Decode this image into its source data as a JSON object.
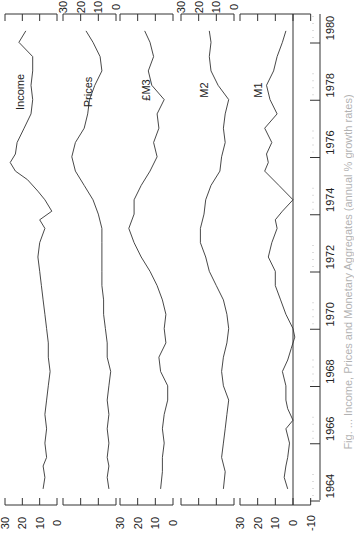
{
  "chart_data": {
    "type": "line",
    "orientation": "rotated-90-clockwise",
    "title": "",
    "caption": "Fig. ... Income, Prices and Monetary Aggregates (annual % growth rates)",
    "xlabel": "",
    "x_ticks": [
      "1964",
      "1966",
      "1968",
      "1970",
      "1972",
      "1974",
      "1976",
      "1978",
      "1980"
    ],
    "xlim": [
      1963.5,
      1980.5
    ],
    "panels": [
      {
        "name": "Income",
        "ylim": [
          0,
          30
        ],
        "y_ticks": [
          "30",
          "20",
          "10",
          "0"
        ],
        "labels_side": "bottom"
      },
      {
        "name": "Prices",
        "ylim": [
          0,
          30
        ],
        "y_ticks": [
          "30",
          "20",
          "10",
          "0"
        ],
        "labels_side": "top"
      },
      {
        "name": "£M3",
        "ylim": [
          0,
          30
        ],
        "y_ticks": [
          "30",
          "20",
          "10",
          "0"
        ],
        "labels_side": "bottom"
      },
      {
        "name": "M2",
        "ylim": [
          0,
          30
        ],
        "y_ticks": [
          "30",
          "20",
          "10",
          "0"
        ],
        "labels_side": "top"
      },
      {
        "name": "M1",
        "ylim": [
          -10,
          30
        ],
        "y_ticks": [
          "30",
          "20",
          "10",
          "0",
          "-10"
        ],
        "labels_side": "bottom",
        "zero_line": true
      }
    ],
    "series": [
      {
        "name": "Income",
        "x": [
          1963.9,
          1964.3,
          1964.7,
          1965.0,
          1965.5,
          1966.0,
          1966.5,
          1967.0,
          1967.5,
          1968.0,
          1968.5,
          1969.0,
          1969.5,
          1970.0,
          1970.5,
          1971.0,
          1971.5,
          1972.0,
          1972.5,
          1973.0,
          1973.3,
          1973.6,
          1974.0,
          1974.3,
          1974.7,
          1975.0,
          1975.3,
          1975.6,
          1976.0,
          1976.5,
          1977.0,
          1977.5,
          1978.0,
          1978.5,
          1979.0,
          1979.5,
          1979.9
        ],
        "values": [
          8,
          7,
          8,
          6,
          7,
          6,
          7,
          6,
          5,
          4,
          5,
          5,
          6,
          7,
          8,
          9,
          10,
          11,
          10,
          7,
          10,
          3,
          7,
          11,
          17,
          24,
          27,
          24,
          23,
          19,
          15,
          14,
          15,
          14,
          14,
          22,
          18
        ]
      },
      {
        "name": "Prices",
        "x": [
          1963.9,
          1964.3,
          1964.7,
          1965.0,
          1965.5,
          1966.0,
          1966.5,
          1967.0,
          1967.5,
          1968.0,
          1968.5,
          1969.0,
          1969.5,
          1970.0,
          1970.5,
          1971.0,
          1971.5,
          1972.0,
          1972.5,
          1973.0,
          1973.5,
          1974.0,
          1974.5,
          1975.0,
          1975.5,
          1976.0,
          1976.5,
          1977.0,
          1977.5,
          1978.0,
          1978.5,
          1979.0,
          1979.5,
          1979.9
        ],
        "values": [
          4,
          5,
          4,
          5,
          4,
          5,
          4,
          5,
          4,
          3,
          5,
          5,
          6,
          7,
          7,
          8,
          8,
          8,
          8,
          8,
          10,
          13,
          18,
          23,
          25,
          23,
          18,
          16,
          15,
          12,
          8,
          9,
          13,
          17
        ]
      },
      {
        "name": "£M3",
        "x": [
          1963.9,
          1964.5,
          1965.0,
          1965.5,
          1966.0,
          1966.5,
          1967.0,
          1967.5,
          1968.0,
          1968.5,
          1969.0,
          1969.5,
          1970.0,
          1970.5,
          1971.0,
          1971.5,
          1972.0,
          1972.5,
          1973.0,
          1973.5,
          1974.0,
          1974.5,
          1975.0,
          1975.5,
          1976.0,
          1976.5,
          1977.0,
          1977.5,
          1978.0,
          1978.5,
          1979.0,
          1979.5,
          1979.9
        ],
        "values": [
          7,
          6,
          6,
          5,
          6,
          5,
          3,
          3,
          7,
          8,
          4,
          5,
          4,
          6,
          9,
          13,
          18,
          22,
          25,
          22,
          22,
          18,
          13,
          9,
          11,
          8,
          9,
          5,
          12,
          14,
          11,
          13,
          16
        ]
      },
      {
        "name": "M2",
        "x": [
          1963.9,
          1964.5,
          1965.0,
          1965.5,
          1966.0,
          1966.5,
          1967.0,
          1967.5,
          1968.0,
          1968.5,
          1969.0,
          1969.5,
          1970.0,
          1970.5,
          1971.0,
          1971.5,
          1972.0,
          1972.5,
          1973.0,
          1973.5,
          1974.0,
          1974.5,
          1975.0,
          1975.5,
          1976.0,
          1976.5,
          1977.0,
          1977.5,
          1978.0,
          1978.5,
          1979.0,
          1979.5,
          1979.9
        ],
        "values": [
          6,
          5,
          7,
          6,
          5,
          4,
          3,
          6,
          7,
          6,
          4,
          3,
          4,
          6,
          10,
          14,
          16,
          19,
          19,
          17,
          16,
          13,
          8,
          7,
          5,
          6,
          5,
          3,
          9,
          13,
          14,
          13,
          14
        ]
      },
      {
        "name": "M1",
        "x": [
          1963.9,
          1964.3,
          1964.7,
          1965.0,
          1965.5,
          1966.0,
          1966.3,
          1966.7,
          1967.0,
          1967.5,
          1968.0,
          1968.4,
          1968.8,
          1969.2,
          1969.5,
          1970.0,
          1970.5,
          1971.0,
          1971.5,
          1972.0,
          1972.5,
          1973.0,
          1973.3,
          1973.6,
          1974.0,
          1974.5,
          1975.0,
          1975.3,
          1975.6,
          1976.0,
          1976.5,
          1977.0,
          1977.5,
          1978.0,
          1978.5,
          1979.0,
          1979.5,
          1979.9
        ],
        "values": [
          3,
          5,
          4,
          3,
          2,
          4,
          0,
          3,
          4,
          4,
          6,
          3,
          1,
          -1,
          0,
          4,
          7,
          10,
          10,
          14,
          12,
          9,
          10,
          6,
          0,
          8,
          16,
          14,
          15,
          12,
          16,
          9,
          13,
          15,
          11,
          9,
          6,
          4
        ]
      }
    ]
  },
  "labels": {
    "income": "Income",
    "prices": "Prices",
    "m3": "£M3",
    "m2": "M2",
    "m1": "M1"
  }
}
